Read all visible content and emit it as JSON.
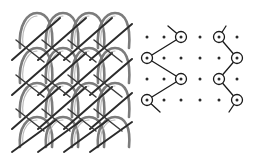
{
  "figure": {
    "background_color": "#ffffff"
  },
  "fabric": {
    "name": "warp-knitted-fabric-photo",
    "description": "Greyscale photograph of a two-bar warp knitted mesh fabric with pillar loops and diagonal underlaps",
    "columns": 4,
    "rows": 4,
    "loop_color": "#6e6e6e",
    "underlap_color": "#2b2b2b",
    "bounds": {
      "x": 10,
      "y": 8,
      "width": 118,
      "height": 140
    }
  },
  "lapping": {
    "grid": {
      "columns": 6,
      "rows": 4,
      "dot_color": "#2a2a2a",
      "dot_radius": 1.5,
      "col_x": [
        147,
        164,
        181,
        200,
        219,
        237
      ],
      "row_y": [
        37,
        58,
        79,
        100
      ]
    },
    "diagrams": [
      {
        "name": "lf",
        "label": "Lf",
        "full_name": "front guide bar lapping",
        "line_color": "#1a1a1a",
        "circle_color": "#1a1a1a",
        "circle_radius": 5.5,
        "needle_points": [
          {
            "col": 2,
            "row": 0
          },
          {
            "col": 0,
            "row": 1
          },
          {
            "col": 2,
            "row": 2
          },
          {
            "col": 0,
            "row": 3
          }
        ],
        "tail_start": {
          "x": 168,
          "y": 26
        },
        "tail_end": {
          "x": 160,
          "y": 112
        }
      },
      {
        "name": "lb",
        "label": "Lb",
        "full_name": "back guide bar lapping",
        "line_color": "#1a1a1a",
        "circle_color": "#1a1a1a",
        "circle_radius": 5.5,
        "needle_points": [
          {
            "col": 4,
            "row": 0
          },
          {
            "col": 5,
            "row": 1
          },
          {
            "col": 4,
            "row": 2
          },
          {
            "col": 5,
            "row": 3
          }
        ],
        "tail_start": {
          "x": 226,
          "y": 26
        },
        "tail_end": {
          "x": 229,
          "y": 112
        }
      }
    ]
  },
  "labels": {
    "lf": "Lf",
    "lb": "Lb",
    "color": "#8d8d8d"
  }
}
